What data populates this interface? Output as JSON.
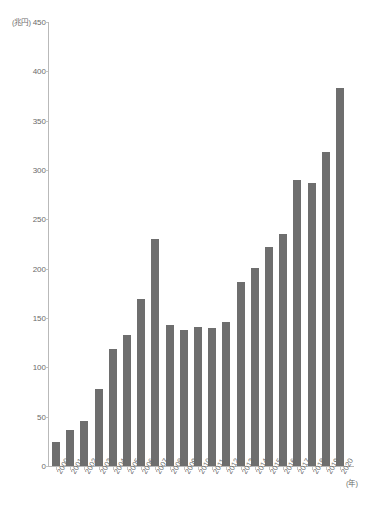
{
  "chart_data": {
    "type": "bar",
    "title": "",
    "xlabel": "(年)",
    "ylabel": "(兆円)",
    "unit_y": "(兆円)",
    "unit_x": "(年)",
    "ylim": [
      0,
      450
    ],
    "ytick_step": 50,
    "grid": false,
    "legend": null,
    "bar_color": "#6e6e6e",
    "axis_color": "#b9b9b9",
    "text_color": "#6a6a6a",
    "yticks": [
      "0",
      "50",
      "100",
      "150",
      "200",
      "250",
      "300",
      "350",
      "400",
      "450"
    ],
    "ytick_values": [
      0,
      50,
      100,
      150,
      200,
      250,
      300,
      350,
      400,
      450
    ],
    "categories": [
      "2000",
      "2001",
      "2002",
      "2003",
      "2004",
      "2005",
      "2006",
      "2007",
      "2008",
      "2009",
      "2010",
      "2011",
      "2012",
      "2013",
      "2014",
      "2015",
      "2016",
      "2017",
      "2018",
      "2019",
      "2020"
    ],
    "values": [
      24,
      36,
      46,
      78,
      119,
      133,
      169,
      230,
      143,
      138,
      141,
      140,
      146,
      186,
      201,
      222,
      235,
      290,
      287,
      318,
      383
    ],
    "source_note": ""
  }
}
